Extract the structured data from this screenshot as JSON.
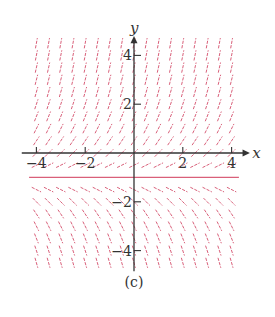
{
  "figure": {
    "caption": "(c)",
    "type": "slope field",
    "equation_hint": "y' = y + 1",
    "equilibrium_y": -1,
    "segment_color": "#d9607a",
    "axis_color": "#333333"
  },
  "axes": {
    "x_label": "x",
    "y_label": "y",
    "x_ticks": [
      {
        "value": -4,
        "label": "−4"
      },
      {
        "value": -2,
        "label": "−2"
      },
      {
        "value": 2,
        "label": "2"
      },
      {
        "value": 4,
        "label": "4"
      }
    ],
    "y_ticks": [
      {
        "value": 4,
        "label": "4"
      },
      {
        "value": 2,
        "label": "2"
      },
      {
        "value": -2,
        "label": "−2"
      },
      {
        "value": -4,
        "label": "−4"
      }
    ],
    "x_range": [
      -4,
      4
    ],
    "y_range": [
      -4.5,
      4.5
    ],
    "grid_step": 0.5
  }
}
